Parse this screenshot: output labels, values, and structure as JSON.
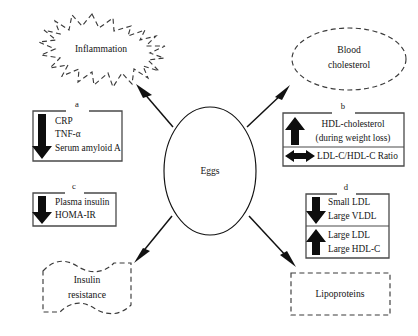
{
  "diagram": {
    "center": {
      "label": "Eggs",
      "shape": "ellipse-solid"
    },
    "outcomes": [
      {
        "id": "inflammation",
        "label": "Inflammation",
        "shape": "starburst-dashed",
        "position": "top-left"
      },
      {
        "id": "blood-cholesterol",
        "label_line1": "Blood",
        "label_line2": "cholesterol",
        "shape": "ellipse-dashed",
        "position": "top-right"
      },
      {
        "id": "insulin-resistance",
        "label_line1": "Insulin",
        "label_line2": "resistance",
        "shape": "banner-dashed",
        "position": "bottom-left"
      },
      {
        "id": "lipoproteins",
        "label": "Lipoproteins",
        "shape": "rectangle-dashed",
        "position": "bottom-right"
      }
    ],
    "panels": [
      {
        "id": "a",
        "letter": "a",
        "position": "left-upper",
        "groups": [
          {
            "arrow": "down-arrow",
            "lines": [
              "CRP",
              "TNF-α",
              "Serum amyloid A"
            ]
          }
        ]
      },
      {
        "id": "b",
        "letter": "b",
        "position": "right-upper",
        "groups": [
          {
            "arrow": "up-arrow",
            "lines": [
              "HDL-cholesterol",
              "(during weight loss)"
            ]
          },
          {
            "arrow": "double-horizontal-arrow",
            "lines": [
              "LDL-C/HDL-C Ratio"
            ]
          }
        ]
      },
      {
        "id": "c",
        "letter": "c",
        "position": "left-lower",
        "groups": [
          {
            "arrow": "down-arrow",
            "lines": [
              "Plasma insulin",
              "HOMA-IR"
            ]
          }
        ]
      },
      {
        "id": "d",
        "letter": "d",
        "position": "right-lower",
        "groups": [
          {
            "arrow": "down-arrow",
            "lines": [
              "Small LDL",
              "Large VLDL"
            ]
          },
          {
            "arrow": "up-arrow",
            "lines": [
              "Large LDL",
              "Large HDL-C"
            ]
          }
        ]
      }
    ],
    "connectors": [
      {
        "id": "eggs-to-inflammation",
        "direction": "up-left"
      },
      {
        "id": "eggs-to-blood-cholesterol",
        "direction": "up-right"
      },
      {
        "id": "eggs-to-insulin-resistance",
        "direction": "down-left"
      },
      {
        "id": "eggs-to-lipoproteins",
        "direction": "down-right"
      }
    ],
    "colors": {
      "stroke": "#111111",
      "dashed_stroke": "#3b3b3b",
      "bracket": "#4a4a4a",
      "text": "#141414",
      "background": "#ffffff"
    }
  }
}
